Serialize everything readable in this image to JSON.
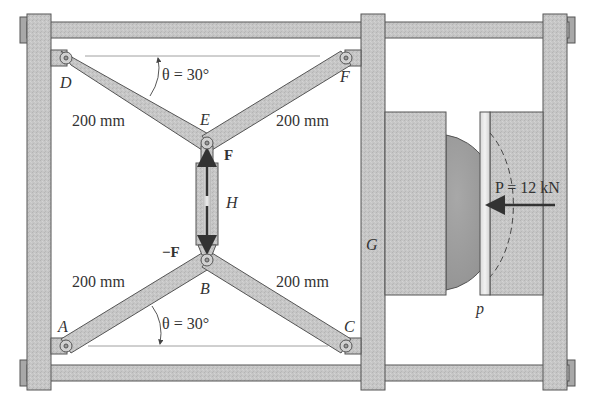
{
  "diagram": {
    "type": "toggle-press mechanism (statics problem figure)",
    "points": {
      "A": "A",
      "B": "B",
      "C": "C",
      "D": "D",
      "E": "E",
      "F": "F",
      "G": "G",
      "H": "H",
      "p": "p"
    },
    "angles": {
      "top": "θ = 30°",
      "bottom": "θ = 30°"
    },
    "lengths": {
      "DE": "200 mm",
      "EF": "200 mm",
      "AB": "200 mm",
      "BC": "200 mm"
    },
    "forces": {
      "upper": "F",
      "lower": "−F",
      "load": "P = 12 kN"
    },
    "colors": {
      "metal": "#c4c4c4",
      "metal_dark": "#9a9a9a",
      "outline": "#555555",
      "hemisphere": "#9d9d9d",
      "arrow": "#333333",
      "plate_highlight": "#e8e8e8"
    }
  }
}
